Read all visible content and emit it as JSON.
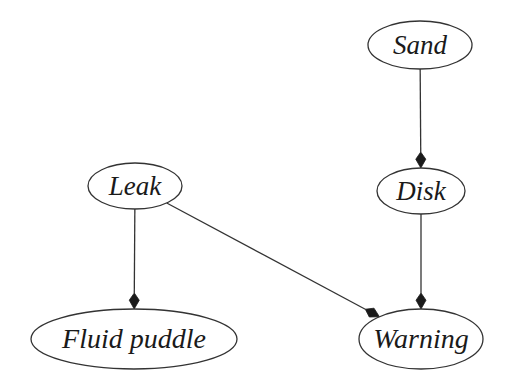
{
  "diagram": {
    "type": "directed-graph",
    "nodes": [
      {
        "id": "sand",
        "label": "Sand",
        "cx": 420,
        "cy": 45,
        "rx": 52,
        "ry": 24,
        "font_size": 27
      },
      {
        "id": "disk",
        "label": "Disk",
        "cx": 421,
        "cy": 191,
        "rx": 44,
        "ry": 23,
        "font_size": 27
      },
      {
        "id": "leak",
        "label": "Leak",
        "cx": 135,
        "cy": 186,
        "rx": 47,
        "ry": 23,
        "font_size": 27
      },
      {
        "id": "fluid_puddle",
        "label": "Fluid puddle",
        "cx": 134,
        "cy": 339,
        "rx": 103,
        "ry": 30,
        "font_size": 28
      },
      {
        "id": "warning",
        "label": "Warning",
        "cx": 421,
        "cy": 339,
        "rx": 62,
        "ry": 30,
        "font_size": 28
      }
    ],
    "edges": [
      {
        "from": "sand",
        "to": "disk"
      },
      {
        "from": "disk",
        "to": "warning"
      },
      {
        "from": "leak",
        "to": "fluid_puddle"
      },
      {
        "from": "leak",
        "to": "warning"
      }
    ],
    "colors": {
      "stroke": "#333333",
      "text": "#1a1a1a",
      "background": "#ffffff"
    }
  }
}
